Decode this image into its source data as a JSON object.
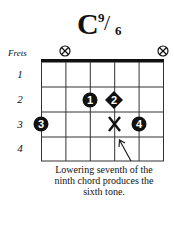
{
  "chord": {
    "name_root": "C",
    "name_sup": "9",
    "name_slash": "/",
    "name_sub": "6"
  },
  "labels": {
    "frets": "Frets"
  },
  "fret_numbers": [
    "1",
    "2",
    "3",
    "4"
  ],
  "strings_muted": [
    1,
    6
  ],
  "fingerings": [
    {
      "finger": "1",
      "string": 3,
      "fret": 2,
      "shape": "circle"
    },
    {
      "finger": "2",
      "string": 4,
      "fret": 2,
      "shape": "diamond"
    },
    {
      "finger": "3",
      "string": 1,
      "fret": 3,
      "shape": "circle"
    },
    {
      "finger": "4",
      "string": 5,
      "fret": 3,
      "shape": "circle"
    },
    {
      "finger": "X",
      "string": 4,
      "fret": 3,
      "shape": "x-mark"
    }
  ],
  "annotation": {
    "line1": "Lowering seventh of the",
    "line2": "ninth chord produces the",
    "line3": "sixth tone."
  },
  "colors": {
    "ink": "#111111",
    "background": "#ffffff"
  }
}
